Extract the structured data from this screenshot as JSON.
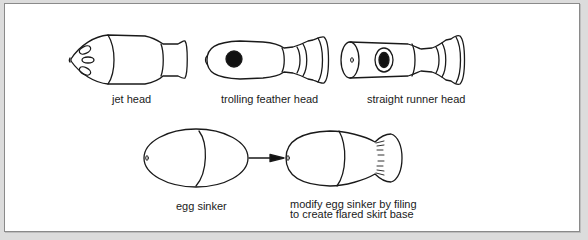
{
  "figure": {
    "row1": [
      {
        "id": "jet-head",
        "label": "jet head"
      },
      {
        "id": "trolling-feather-head",
        "label": "trolling feather head"
      },
      {
        "id": "straight-runner-head",
        "label": "straight runner head"
      }
    ],
    "row2": [
      {
        "id": "egg-sinker",
        "label": "egg sinker"
      },
      {
        "id": "modified-egg-sinker",
        "label_line1": "modify egg sinker by filing",
        "label_line2": "to create flared skirt base"
      }
    ],
    "arrow": {
      "from": "egg-sinker",
      "to": "modified-egg-sinker"
    }
  },
  "colors": {
    "background": "#dcdcdc",
    "panel": "#ffffff",
    "border": "#8a8a8a",
    "stroke": "#1a1a1a"
  }
}
